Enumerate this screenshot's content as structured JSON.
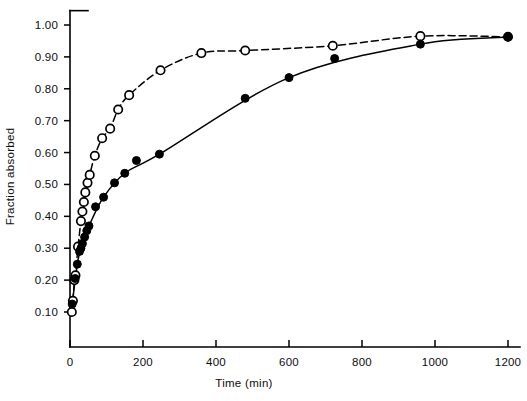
{
  "chart_data": {
    "type": "scatter",
    "title": "",
    "xlabel": "Time (min)",
    "ylabel": "Fraction absorbed",
    "xlim": [
      0,
      1230
    ],
    "ylim": [
      0,
      1.05
    ],
    "xticks": [
      0,
      200,
      400,
      600,
      800,
      1000,
      1200
    ],
    "xtick_labels": [
      "0",
      "200",
      "400",
      "600",
      "800",
      "1000",
      "1200"
    ],
    "yticks": [
      0.1,
      0.2,
      0.3,
      0.4,
      0.5,
      0.6,
      0.7,
      0.8,
      0.9,
      1.0
    ],
    "ytick_labels": [
      "0.10",
      "0.20",
      "0.30",
      "0.40",
      "0.50",
      "0.60",
      "0.70",
      "0.80",
      "0.90",
      "1.00"
    ],
    "grid": false,
    "legend": "none",
    "series": [
      {
        "name": "open-circles",
        "marker": "open circle",
        "line_style": "dashed",
        "points": [
          {
            "x": 5,
            "y": 0.1
          },
          {
            "x": 8,
            "y": 0.135
          },
          {
            "x": 12,
            "y": 0.2
          },
          {
            "x": 15,
            "y": 0.215
          },
          {
            "x": 22,
            "y": 0.305
          },
          {
            "x": 30,
            "y": 0.385
          },
          {
            "x": 34,
            "y": 0.415
          },
          {
            "x": 38,
            "y": 0.445
          },
          {
            "x": 42,
            "y": 0.475
          },
          {
            "x": 48,
            "y": 0.505
          },
          {
            "x": 54,
            "y": 0.53
          },
          {
            "x": 68,
            "y": 0.59
          },
          {
            "x": 88,
            "y": 0.645
          },
          {
            "x": 110,
            "y": 0.675
          },
          {
            "x": 132,
            "y": 0.735
          },
          {
            "x": 162,
            "y": 0.78
          },
          {
            "x": 248,
            "y": 0.858
          },
          {
            "x": 360,
            "y": 0.912
          },
          {
            "x": 480,
            "y": 0.92
          },
          {
            "x": 720,
            "y": 0.935
          },
          {
            "x": 960,
            "y": 0.965
          },
          {
            "x": 1200,
            "y": 0.963
          }
        ]
      },
      {
        "name": "filled-circles",
        "marker": "filled circle",
        "line_style": "solid",
        "points": [
          {
            "x": 6,
            "y": 0.125
          },
          {
            "x": 14,
            "y": 0.205
          },
          {
            "x": 20,
            "y": 0.25
          },
          {
            "x": 26,
            "y": 0.29
          },
          {
            "x": 30,
            "y": 0.3
          },
          {
            "x": 34,
            "y": 0.315
          },
          {
            "x": 40,
            "y": 0.335
          },
          {
            "x": 46,
            "y": 0.355
          },
          {
            "x": 52,
            "y": 0.37
          },
          {
            "x": 70,
            "y": 0.43
          },
          {
            "x": 92,
            "y": 0.46
          },
          {
            "x": 122,
            "y": 0.505
          },
          {
            "x": 150,
            "y": 0.535
          },
          {
            "x": 182,
            "y": 0.575
          },
          {
            "x": 245,
            "y": 0.595
          },
          {
            "x": 480,
            "y": 0.77
          },
          {
            "x": 600,
            "y": 0.835
          },
          {
            "x": 725,
            "y": 0.895
          },
          {
            "x": 960,
            "y": 0.94
          },
          {
            "x": 1200,
            "y": 0.962
          }
        ]
      }
    ]
  }
}
